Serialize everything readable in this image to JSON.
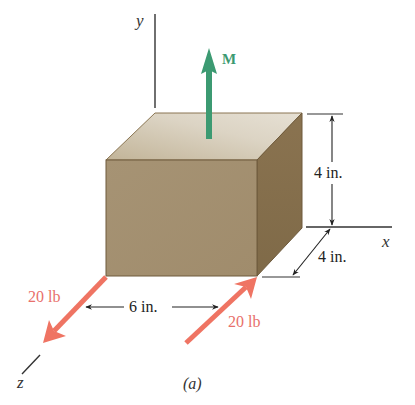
{
  "figure": {
    "caption": "(a)",
    "axes": {
      "x_label": "x",
      "y_label": "y",
      "z_label": "z"
    },
    "moment": {
      "label": "M",
      "direction": "+y",
      "color": "#3c9a72"
    },
    "forces": [
      {
        "label": "20 lb",
        "position": "front-left bottom corner",
        "direction": "+z (toward viewer)",
        "color": "#ef7463"
      },
      {
        "label": "20 lb",
        "position": "front-right bottom corner",
        "direction": "-z (away from viewer)",
        "color": "#ef7463"
      }
    ],
    "dimensions": {
      "height": "4 in.",
      "depth": "4 in.",
      "width": "6 in."
    },
    "block_colors": {
      "front": "#a89575",
      "top": "#d8cfbd",
      "side": "#8c7550",
      "edge": "#6e5a3c"
    }
  }
}
